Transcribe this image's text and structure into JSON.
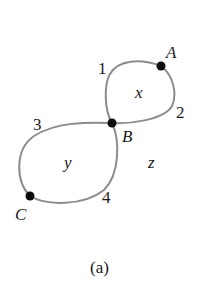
{
  "diagram": {
    "type": "planar-graph",
    "caption": "(a)",
    "vertices": [
      {
        "id": "A",
        "label": "A"
      },
      {
        "id": "B",
        "label": "B"
      },
      {
        "id": "C",
        "label": "C"
      }
    ],
    "edges": [
      {
        "id": "1",
        "label": "1",
        "from": "B",
        "to": "A"
      },
      {
        "id": "2",
        "label": "2",
        "from": "A",
        "to": "B"
      },
      {
        "id": "3",
        "label": "3",
        "from": "B",
        "to": "C"
      },
      {
        "id": "4",
        "label": "4",
        "from": "C",
        "to": "B"
      }
    ],
    "faces": [
      {
        "id": "x",
        "label": "x"
      },
      {
        "id": "y",
        "label": "y"
      },
      {
        "id": "z",
        "label": "z"
      }
    ],
    "colors": {
      "edge": "#8c8c8c",
      "vertex": "#0d0d0d",
      "text": "#1a1a1a",
      "background": "#ffffff"
    }
  }
}
